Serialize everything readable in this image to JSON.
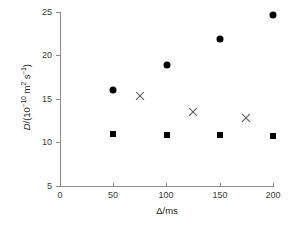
{
  "chart_data": {
    "type": "scatter",
    "title": "",
    "xlabel": "Δ/ms",
    "ylabel": "D/(10⁻¹⁰ m² s⁻¹)",
    "xlim": [
      0,
      200
    ],
    "ylim": [
      5,
      25
    ],
    "grid": false,
    "legend": "none",
    "xticks": [
      0,
      50,
      100,
      150,
      200
    ],
    "yticks": [
      5,
      10,
      15,
      20,
      25
    ],
    "xtick_labels": [
      "0",
      "50",
      "100",
      "150",
      "200"
    ],
    "ytick_labels": [
      "5",
      "10",
      "15",
      "20",
      "25"
    ],
    "series": [
      {
        "name": "filled-circle",
        "marker": "circle",
        "color": "#000000",
        "x": [
          50,
          100,
          150,
          200
        ],
        "values": [
          16.0,
          18.9,
          21.9,
          24.6
        ]
      },
      {
        "name": "filled-square",
        "marker": "square",
        "color": "#000000",
        "x": [
          50,
          100,
          150,
          200
        ],
        "values": [
          10.95,
          10.85,
          10.85,
          10.8
        ]
      },
      {
        "name": "cross",
        "marker": "x",
        "color": "#555555",
        "x": [
          75,
          125,
          175
        ],
        "values": [
          15.4,
          13.5,
          12.8
        ]
      }
    ]
  },
  "axis_label_parts": {
    "y_prefix": "D",
    "y_rest_1": "/(10",
    "y_exp": "−10",
    "y_rest_2": " m",
    "y_sup_2": "2",
    "y_rest_3": " s",
    "y_sup_m1": "−1",
    "y_rest_4": ")",
    "x_full": "Δ/ms"
  },
  "colors": {
    "axis": "#8a8a8a",
    "marker_dark": "#000000",
    "marker_cross": "#555555",
    "text": "#1a1a1a",
    "background": "#ffffff"
  }
}
